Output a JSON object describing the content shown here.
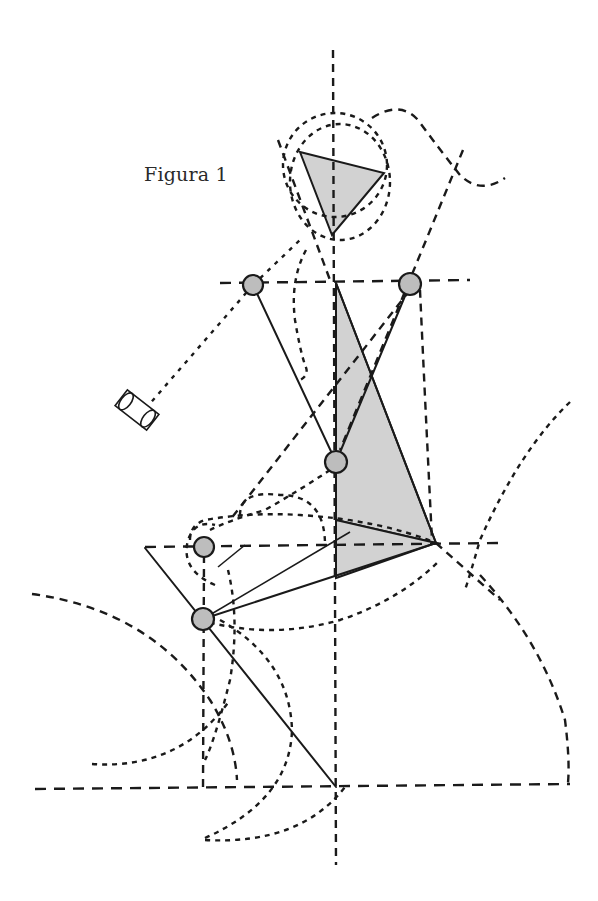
{
  "figure": {
    "caption": "Figura 1",
    "colors": {
      "line": "#1a1a1a",
      "shade": "#d2d2d2",
      "joint_fill": "#bdbdbd",
      "background": "#ffffff"
    },
    "joints": [
      {
        "name": "left-shoulder",
        "x": 253,
        "y": 285
      },
      {
        "name": "right-shoulder",
        "x": 410,
        "y": 284
      },
      {
        "name": "pelvis",
        "x": 336,
        "y": 462
      },
      {
        "name": "left-hip",
        "x": 204,
        "y": 547
      },
      {
        "name": "knee",
        "x": 203,
        "y": 619
      }
    ],
    "reference_lines": {
      "vertical_axis_x": 336,
      "shoulder_line_y": 283,
      "hip_line_y": 545,
      "ground_line_y": 787
    }
  }
}
